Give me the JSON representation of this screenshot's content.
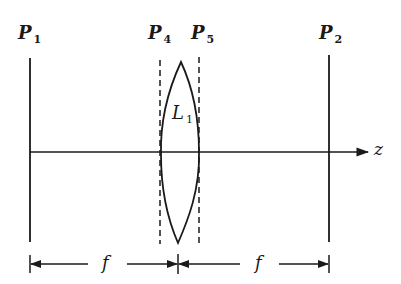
{
  "diagram": {
    "title": "",
    "planes": [
      {
        "id": "P1",
        "base": "P",
        "sub": "1",
        "style": "solid"
      },
      {
        "id": "P4",
        "base": "P",
        "sub": "4",
        "style": "dashed"
      },
      {
        "id": "P5",
        "base": "P",
        "sub": "5",
        "style": "dashed"
      },
      {
        "id": "P2",
        "base": "P",
        "sub": "2",
        "style": "solid"
      }
    ],
    "lens": {
      "base": "L",
      "sub": "1",
      "type": "biconvex"
    },
    "axis": {
      "label": "z"
    },
    "dimensions": [
      {
        "label": "f",
        "from": "P1",
        "to": "L1"
      },
      {
        "label": "f",
        "from": "L1",
        "to": "P2"
      }
    ],
    "colors": {
      "line": "#1a1a1a",
      "background": "#ffffff"
    }
  }
}
